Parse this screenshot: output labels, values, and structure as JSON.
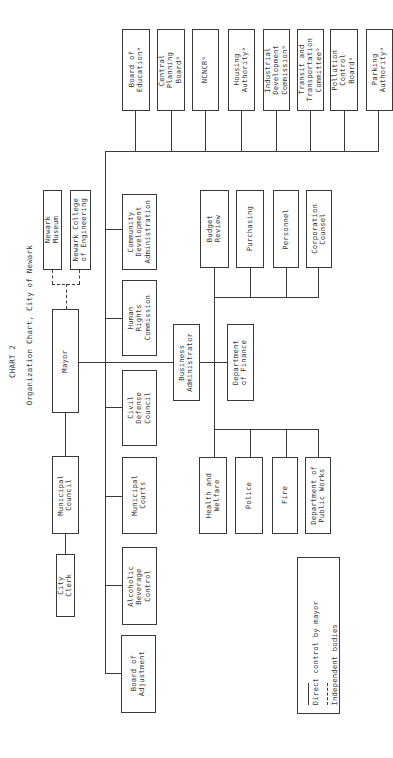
{
  "title": {
    "chart_number": "CHART 2",
    "caption": "Organization Chart, City of Newark"
  },
  "nodes": {
    "mayor": "Mayor",
    "municipal_council": "Municipal\nCouncil",
    "city_clerk": "City\nClerk",
    "newark_museum": "Newark\nMuseum",
    "newark_college": "Newark College\nof Engineering",
    "business_administrator": "Business\nAdministrator",
    "department_of_finance": "Department\nof Finance",
    "mayor_direct": [
      "Community\nDevelopment\nAdministration",
      "Human\nRights\nCommission",
      "Civil\nDefense\nCouncil",
      "Municipal\nCourts",
      "Alcoholic\nBeverage\nControl",
      "Board of\nAdjustment"
    ],
    "independent_bodies": [
      "Board of\nEducationᵃ",
      "Central\nPlanning\nBoardᵃ",
      "NCNCRᵇ",
      "Housing\nAuthorityᵃ",
      "Industrial\nDevelopment\nCommissionᵇ",
      "Transit and\nTransportation\nCommitteeᵇ",
      "Pollution\nControl\nBoardᵇ",
      "Parking\nAuthorityᵃ"
    ],
    "finance_units": [
      "Budget\nReview",
      "Purchasing",
      "Personnel",
      "Corporation\nCounsel"
    ],
    "departments": [
      "Health and\nWelfare",
      "Police",
      "Fire",
      "Department of\nPublic Works"
    ]
  },
  "legend": {
    "solid": "Direct control by mayor",
    "dashed": "Independent bodies"
  }
}
